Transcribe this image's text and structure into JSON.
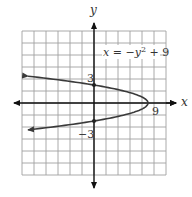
{
  "chart_data": {
    "type": "line",
    "title": "",
    "equation_label": "x = −y² + 9",
    "equation_parts": {
      "lhs": "x",
      "eq": " = −",
      "var": "y",
      "exp": "2",
      "rest": " + 9"
    },
    "xlabel": "x",
    "ylabel": "y",
    "xlim": [
      -12,
      12
    ],
    "ylim": [
      -12,
      12
    ],
    "grid": true,
    "grid_step": 2,
    "tick_labels": {
      "x": [
        "9"
      ],
      "y": [
        "3",
        "−3"
      ]
    },
    "tick_label_values": {
      "x9": "9",
      "y3": "3",
      "yneg3": "−3"
    },
    "series": [
      {
        "name": "x = -y^2 + 9",
        "equation": "x = -y^2 + 9",
        "orientation": "horizontal parabola opening left",
        "points": [
          {
            "x": -11,
            "y": 4.47
          },
          {
            "x": -7,
            "y": 4
          },
          {
            "x": 0,
            "y": 3
          },
          {
            "x": 5,
            "y": 2
          },
          {
            "x": 8,
            "y": 1
          },
          {
            "x": 9,
            "y": 0
          },
          {
            "x": 8,
            "y": -1
          },
          {
            "x": 5,
            "y": -2
          },
          {
            "x": 0,
            "y": -3
          },
          {
            "x": -7,
            "y": -4
          },
          {
            "x": -11,
            "y": -4.47
          }
        ],
        "marked_points": [
          {
            "x": 0,
            "y": 3
          },
          {
            "x": 0,
            "y": -3
          },
          {
            "x": 9,
            "y": 0
          }
        ],
        "arrows_at_ends": true
      }
    ],
    "legend": "none",
    "colors": {
      "curve": "#3a3a3a",
      "grid": "#9a9a9a",
      "axis": "#111111"
    }
  }
}
